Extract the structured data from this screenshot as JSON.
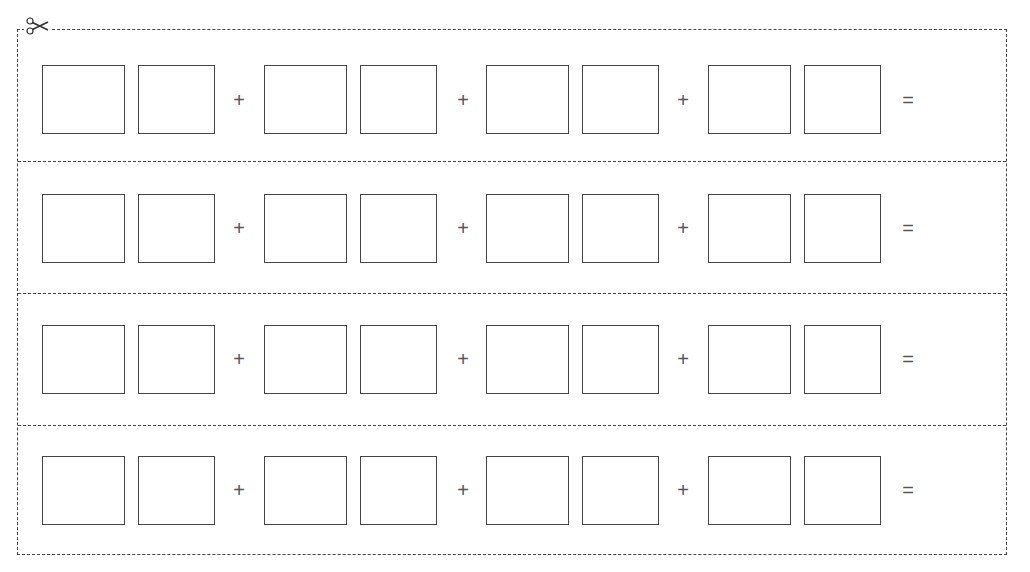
{
  "worksheet": {
    "cut_icon": "scissors-icon",
    "rows": [
      {
        "operators": [
          "+",
          "+",
          "+",
          "="
        ]
      },
      {
        "operators": [
          "+",
          "+",
          "+",
          "="
        ]
      },
      {
        "operators": [
          "+",
          "+",
          "+",
          "="
        ]
      },
      {
        "operators": [
          "+",
          "+",
          "+",
          "="
        ]
      }
    ],
    "boxes_per_row": 8,
    "border_color": "#444444"
  }
}
